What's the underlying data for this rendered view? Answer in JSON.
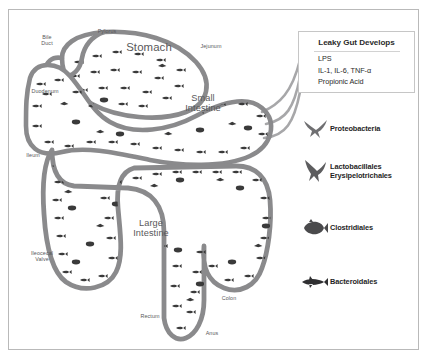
{
  "figure": {
    "border_color": "#b9b9b9",
    "gut_wall_color": "#8a8a8c",
    "microbe_color": "#3a3a3a",
    "label_color": "#58585a"
  },
  "anatomy": {
    "bile_duct": "Bile\nDuct",
    "pylorus": "Pylorus",
    "stomach": "Stomach",
    "jejunum": "Jejunum",
    "duodenum": "Duodenum",
    "small_intestine": "Small\nIntestine",
    "ileum": "Ileum",
    "ileocecal_valve": "Ileocecal\nValve",
    "large_intestine": "Large\nIntestine",
    "colon": "Colon",
    "rectum": "Rectum",
    "anus": "Anus"
  },
  "leaky_gut": {
    "title": "Leaky Gut Develops",
    "items": [
      "LPS",
      "IL-1, IL-6, TNF-α",
      "Propionic Acid"
    ]
  },
  "taxa": [
    {
      "icon": "swift-bird-icon",
      "label": "Proteobacteria"
    },
    {
      "icon": "soaring-bird-icon",
      "label": "Lactobacillales\nErysipelotrichales"
    },
    {
      "icon": "round-fish-icon",
      "label": "Clostridiales"
    },
    {
      "icon": "slender-fish-icon",
      "label": "Bacteroidales"
    }
  ]
}
